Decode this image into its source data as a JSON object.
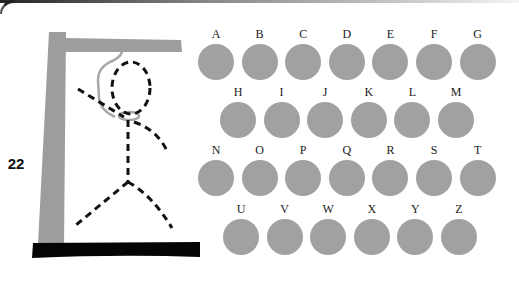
{
  "game": {
    "title": "Hangman",
    "remaining_counter": "22",
    "colors": {
      "gallows": "#9d9d9d",
      "base": "#050505",
      "figure": "#111111",
      "rope": "#a8a8a8",
      "letter_button": "#a1a1a1",
      "letter_text": "#222222"
    }
  },
  "keyboard": {
    "rows": [
      {
        "y": 27,
        "x0": 198,
        "letters": [
          "A",
          "B",
          "C",
          "D",
          "E",
          "F",
          "G"
        ]
      },
      {
        "y": 85,
        "x0": 220,
        "letters": [
          "H",
          "I",
          "J",
          "K",
          "L",
          "M"
        ]
      },
      {
        "y": 143,
        "x0": 198,
        "letters": [
          "N",
          "O",
          "P",
          "Q",
          "R",
          "S",
          "T"
        ]
      },
      {
        "y": 202,
        "x0": 223,
        "letters": [
          "U",
          "V",
          "W",
          "X",
          "Y",
          "Z"
        ]
      }
    ],
    "spacing": 43.6
  }
}
